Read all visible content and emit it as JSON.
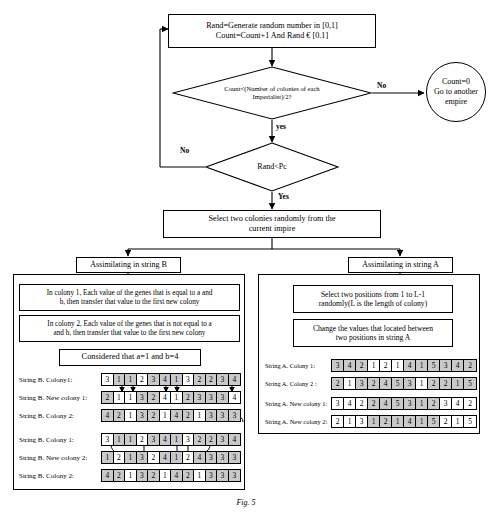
{
  "flow": {
    "top_box": {
      "line1": "Rand=Generate random number in [0,1]",
      "line2": "Count=Count+1 And  Rand € [0.1]"
    },
    "decision1": {
      "line1": "Count<(Number of colonies of each",
      "line2": "Imperialist)/2?"
    },
    "decision1_no_label": "No",
    "decision1_yes_label": "yes",
    "terminal": {
      "line1": "Count=0",
      "line2": "Go to another",
      "line3": "empire"
    },
    "decision2": {
      "text": "Rand<Pc"
    },
    "decision2_no_label": "No",
    "decision2_yes_label": "Yes",
    "select_box": {
      "line1": "Select two colonies randomly from the",
      "line2": "current impire"
    },
    "assimilate_b": "Assimilating in string B",
    "assimilate_a": "Assimilating in string A"
  },
  "left_panel": {
    "step1": {
      "line1": "In colony 1, Each value of the genes that is equal to a and",
      "line2": "b, then transfer that value to the first new colony"
    },
    "step2": {
      "line1": "In colony 2, Each value of the genes that is not equal to a",
      "line2": "and b, then transfer that value to the first new colony"
    },
    "considered": "Considered that a=1 and b=4",
    "rows": [
      {
        "label": "String B. Colony1:",
        "values": [
          3,
          1,
          1,
          2,
          3,
          4,
          1,
          3,
          2,
          2,
          3,
          4
        ],
        "highlight": [
          1,
          2,
          4,
          5,
          6,
          8,
          9,
          10,
          11
        ]
      },
      {
        "label": "String B. New colony 1:",
        "values": [
          2,
          1,
          1,
          3,
          2,
          4,
          1,
          2,
          3,
          3,
          3,
          4
        ],
        "highlight": [
          0,
          3,
          4,
          7,
          8,
          9,
          10
        ]
      },
      {
        "label": "String B. Colony 2:",
        "values": [
          4,
          2,
          1,
          3,
          2,
          1,
          4,
          2,
          1,
          3,
          3,
          3
        ],
        "highlight": [
          0,
          1,
          3,
          4,
          6,
          7,
          9,
          10,
          11
        ]
      },
      {
        "label": "String B. Colony 1:",
        "values": [
          3,
          1,
          1,
          2,
          3,
          4,
          1,
          3,
          2,
          2,
          3,
          4
        ],
        "highlight": [
          1,
          2,
          4,
          5,
          6,
          8,
          9,
          10,
          11
        ]
      },
      {
        "label": "String B. New colony 2:",
        "values": [
          1,
          2,
          1,
          3,
          2,
          4,
          1,
          2,
          4,
          3,
          3,
          3
        ],
        "highlight": [
          0,
          2,
          3,
          5,
          6,
          8,
          9,
          10,
          11
        ]
      },
      {
        "label": "String B. Colony 2:",
        "values": [
          4,
          2,
          1,
          3,
          2,
          1,
          4,
          2,
          1,
          3,
          3,
          3
        ],
        "highlight": [
          0,
          1,
          3,
          4,
          6,
          7,
          9,
          10,
          11
        ]
      }
    ]
  },
  "right_panel": {
    "step1": {
      "line1": "Select two positions from 1 to L-1",
      "line2": "randomly(L is the length of colony)"
    },
    "step2": {
      "line1": "Change the values that located between",
      "line2": "two positions in string A"
    },
    "rows": [
      {
        "label": "String A. Colony 1:",
        "values": [
          3,
          4,
          2,
          1,
          2,
          1,
          4,
          1,
          5,
          3,
          4,
          2
        ],
        "highlight": [
          0,
          1,
          2,
          6,
          7,
          8,
          9,
          10,
          11
        ]
      },
      {
        "label": "String A. Colony  2 :",
        "values": [
          2,
          1,
          3,
          2,
          4,
          5,
          3,
          1,
          2,
          2,
          1,
          5
        ],
        "highlight": [
          0,
          2,
          3,
          4,
          5,
          6,
          8,
          9,
          10,
          11
        ]
      },
      {
        "label": "String A. New colony 1:",
        "values": [
          3,
          4,
          2,
          2,
          4,
          5,
          3,
          1,
          2,
          3,
          4,
          2
        ],
        "highlight": [
          3,
          4,
          5,
          6,
          7,
          8
        ]
      },
      {
        "label": "String A. New colony 2:",
        "values": [
          2,
          1,
          3,
          1,
          2,
          1,
          4,
          1,
          5,
          2,
          1,
          5
        ],
        "highlight": [
          3,
          4,
          5,
          6,
          7,
          8
        ]
      }
    ]
  },
  "figure_caption": "Fig. 5"
}
